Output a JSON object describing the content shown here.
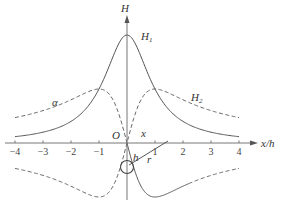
{
  "chart_data": {
    "type": "line",
    "title": "",
    "xlabel": "x/h",
    "ylabel": "H",
    "xlim": [
      -4,
      4
    ],
    "x_ticks": [
      "-4",
      "-3",
      "-2",
      "-1",
      "1",
      "2",
      "3",
      "4"
    ],
    "grid": false,
    "series": [
      {
        "name": "H1",
        "style": "solid",
        "formula": "1/(1+u^2)",
        "x": [
          -4,
          -3,
          -2,
          -1,
          0,
          1,
          2,
          3,
          4
        ],
        "values": [
          0.06,
          0.1,
          0.2,
          0.5,
          1.0,
          0.5,
          0.2,
          0.1,
          0.06
        ]
      },
      {
        "name": "H2",
        "style": "dashed",
        "formula": "|u|/(1+u^2)",
        "x": [
          -4,
          -3,
          -2,
          -1,
          0,
          1,
          2,
          3,
          4
        ],
        "values": [
          0.24,
          0.3,
          0.4,
          0.5,
          0.0,
          0.5,
          0.4,
          0.3,
          0.24
        ]
      },
      {
        "name": "H2 (lower, left)",
        "style": "dashed",
        "x": [
          -4,
          -3,
          -2,
          -1,
          -0.5,
          0
        ],
        "values": [
          -0.24,
          -0.3,
          -0.4,
          -0.5,
          -0.4,
          0.0
        ]
      },
      {
        "name": "Hx (lower, right solid)",
        "style": "solid",
        "x": [
          0,
          0.5,
          1,
          2,
          3,
          4
        ],
        "values": [
          0.0,
          -0.4,
          -0.5,
          -0.4,
          -0.3,
          -0.24
        ]
      },
      {
        "name": "H2 (lower, right tail)",
        "style": "dashed",
        "x": [
          2,
          3,
          4
        ],
        "values": [
          -0.4,
          -0.3,
          -0.24
        ]
      }
    ]
  },
  "labels": {
    "y_axis": "H",
    "x_axis": "x/h",
    "origin": "O",
    "h1": "H",
    "h1_sub": "1",
    "h2": "H",
    "h2_sub": "2",
    "alpha": "α",
    "x": "x",
    "h": "h",
    "r": "r"
  },
  "ticks": [
    {
      "label": "-4",
      "value": -4
    },
    {
      "label": "-3",
      "value": -3
    },
    {
      "label": "-2",
      "value": -2
    },
    {
      "label": "-1",
      "value": -1
    },
    {
      "label": "1",
      "value": 1
    },
    {
      "label": "2",
      "value": 2
    },
    {
      "label": "3",
      "value": 3
    },
    {
      "label": "4",
      "value": 4
    }
  ]
}
